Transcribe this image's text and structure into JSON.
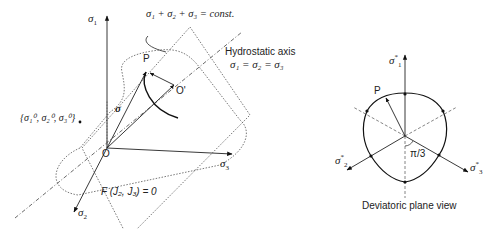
{
  "left_figure": {
    "axis_sigma1": "σ",
    "axis_sigma1_sub": "1",
    "axis_sigma2": "σ",
    "axis_sigma2_sub": "2",
    "axis_sigma3": "σ",
    "axis_sigma3_sub": "3",
    "plane_equation": "σ₁ + σ₂ + σ₃ = const.",
    "hydrostatic_title": "Hydrostatic axis",
    "hydrostatic_equation": "σ₁ = σ₂ = σ₃",
    "point_p": "P",
    "point_o_prime": "O'",
    "point_o": "O",
    "vector_sigma": "σ",
    "reference_point": "{σ₁⁰, σ₂⁰, σ₃⁰}",
    "yield_function": "F (J₂, J₃) = 0"
  },
  "right_figure": {
    "axis_sigma1": "σ",
    "axis_sigma1_sub": "1",
    "axis_sigma2": "σ",
    "axis_sigma2_sub": "2",
    "axis_sigma3": "σ",
    "axis_sigma3_sub": "3",
    "axis_star": "*",
    "point_p": "P",
    "angle_label": "π/3",
    "caption": "Deviatoric plane view"
  }
}
